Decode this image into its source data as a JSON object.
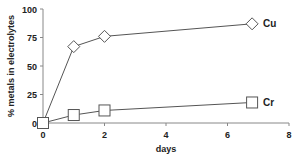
{
  "chart_data": {
    "type": "line",
    "title": "",
    "xlabel": "days",
    "ylabel": "% metals in electrolytes",
    "xlim": [
      0,
      8
    ],
    "ylim": [
      0,
      100
    ],
    "xticks": [
      0,
      2,
      4,
      6,
      8
    ],
    "yticks": [
      0,
      25,
      50,
      75,
      100
    ],
    "grid": false,
    "legend_position": "inline-right",
    "series": [
      {
        "name": "Cu",
        "marker": "diamond",
        "x": [
          0,
          1,
          2,
          6.8
        ],
        "values": [
          0,
          67,
          76,
          87
        ]
      },
      {
        "name": "Cr",
        "marker": "square",
        "x": [
          0,
          1,
          2,
          6.8
        ],
        "values": [
          0,
          7,
          11,
          18
        ]
      }
    ]
  },
  "colors": {
    "line": "#555555",
    "marker_fill": "#ffffff",
    "axis": "#888888",
    "text": "#222222"
  }
}
